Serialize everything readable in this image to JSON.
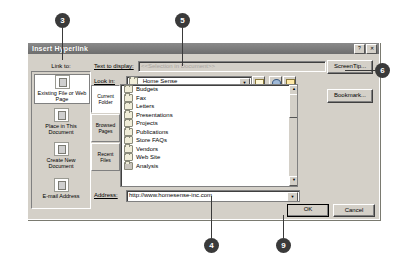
{
  "dialog": {
    "title": "Insert Hyperlink",
    "titlebar_buttons": [
      {
        "name": "help-button",
        "glyph": "?"
      },
      {
        "name": "close-button",
        "glyph": "✕"
      }
    ],
    "link_to_label": "Link to:",
    "nav_items": [
      {
        "label": "Existing File or Web Page",
        "icon": "existing-file-icon",
        "selected": true
      },
      {
        "label": "Place in This Document",
        "icon": "place-in-document-icon",
        "selected": false
      },
      {
        "label": "Create New Document",
        "icon": "create-new-document-icon",
        "selected": false
      },
      {
        "label": "E-mail Address",
        "icon": "email-address-icon",
        "selected": false
      }
    ],
    "text_to_display": {
      "label": "Text to display:",
      "value": "<<Selection in Document>>",
      "disabled": true
    },
    "screentip_button": "ScreenTip...",
    "bookmark_button": "Bookmark...",
    "look_in": {
      "label": "Look in:",
      "value": "Home Sense"
    },
    "toolbar_buttons": [
      {
        "label": "up-one-level",
        "icon": "up-folder-icon"
      },
      {
        "label": "browse-the-web",
        "icon": "globe-icon"
      },
      {
        "label": "browse-for-file",
        "icon": "open-folder-icon"
      }
    ],
    "scope_buttons": [
      {
        "label": "Current Folder",
        "selected": true
      },
      {
        "label": "Browsed Pages",
        "selected": false
      },
      {
        "label": "Recent Files",
        "selected": false
      }
    ],
    "file_list": [
      {
        "name": "Budgets",
        "selected": false
      },
      {
        "name": "Fax",
        "selected": false
      },
      {
        "name": "Letters",
        "selected": false
      },
      {
        "name": "Presentations",
        "selected": false
      },
      {
        "name": "Projects",
        "selected": false
      },
      {
        "name": "Publications",
        "selected": false
      },
      {
        "name": "Store FAQs",
        "selected": false
      },
      {
        "name": "Vendors",
        "selected": false
      },
      {
        "name": "Web Site",
        "selected": false
      },
      {
        "name": "Analysis",
        "selected": true
      }
    ],
    "address": {
      "label": "Address:",
      "value": "http://www.homesense-inc.com"
    },
    "ok_button": "OK",
    "cancel_button": "Cancel"
  },
  "callouts": [
    {
      "number": "3"
    },
    {
      "number": "5"
    },
    {
      "number": "6"
    },
    {
      "number": "4"
    },
    {
      "number": "9"
    }
  ]
}
